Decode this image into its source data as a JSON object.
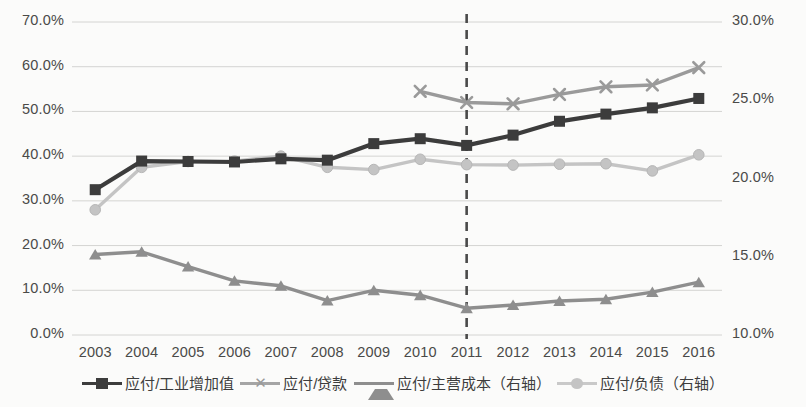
{
  "chart_data": {
    "type": "line",
    "title": "",
    "xlabel": "",
    "ylabel": "",
    "grid": true,
    "legend_position": "bottom",
    "categories": [
      "2003",
      "2004",
      "2005",
      "2006",
      "2007",
      "2008",
      "2009",
      "2010",
      "2011",
      "2012",
      "2013",
      "2014",
      "2015",
      "2016"
    ],
    "axes": {
      "left": {
        "label": "",
        "ylim": [
          0.0,
          70.0
        ],
        "ticks": [
          "0.0%",
          "10.0%",
          "20.0%",
          "30.0%",
          "40.0%",
          "50.0%",
          "60.0%",
          "70.0%"
        ],
        "tick_values": [
          0.0,
          10.0,
          20.0,
          30.0,
          40.0,
          50.0,
          60.0,
          70.0
        ]
      },
      "right": {
        "label": "",
        "ylim": [
          10.0,
          30.0
        ],
        "ticks": [
          "10.0%",
          "15.0%",
          "20.0%",
          "25.0%",
          "30.0%"
        ],
        "tick_values": [
          10.0,
          15.0,
          20.0,
          25.0,
          30.0
        ]
      }
    },
    "annotations": [
      {
        "type": "vertical-dashed-line",
        "x": "2011",
        "color": "#4a4a4a"
      }
    ],
    "series": [
      {
        "name": "应付/工业增加值",
        "axis": "left",
        "marker": "square",
        "color": "#3c3c3c",
        "values": [
          32.5,
          38.9,
          38.8,
          38.7,
          39.4,
          39.1,
          42.8,
          43.9,
          42.4,
          44.7,
          47.8,
          49.4,
          50.8,
          52.9
        ]
      },
      {
        "name": "应付/贷款",
        "axis": "left",
        "marker": "x",
        "color": "#9a9a9a",
        "values": [
          null,
          null,
          null,
          null,
          null,
          null,
          null,
          54.5,
          52.0,
          51.7,
          53.8,
          55.5,
          55.9,
          59.8
        ]
      },
      {
        "name": "应付/主营成本（右轴）",
        "axis": "left",
        "marker": "triangle",
        "color": "#8e8e8e",
        "values": [
          18.0,
          18.6,
          15.3,
          12.1,
          11.0,
          7.7,
          10.0,
          8.9,
          6.0,
          6.7,
          7.6,
          8.0,
          9.6,
          11.8
        ]
      },
      {
        "name": "应付/负债（右轴）",
        "axis": "left",
        "marker": "circle",
        "color": "#c4c4c4",
        "values": [
          28.0,
          37.5,
          38.8,
          38.9,
          40.0,
          37.5,
          37.0,
          39.3,
          38.1,
          38.0,
          38.2,
          38.3,
          36.7,
          40.3
        ]
      }
    ]
  },
  "legend": {
    "items": [
      {
        "label": "应付/工业增加值"
      },
      {
        "label": "应付/贷款"
      },
      {
        "label": "应付/主营成本（右轴）"
      },
      {
        "label": "应付/负债（右轴）"
      }
    ]
  }
}
